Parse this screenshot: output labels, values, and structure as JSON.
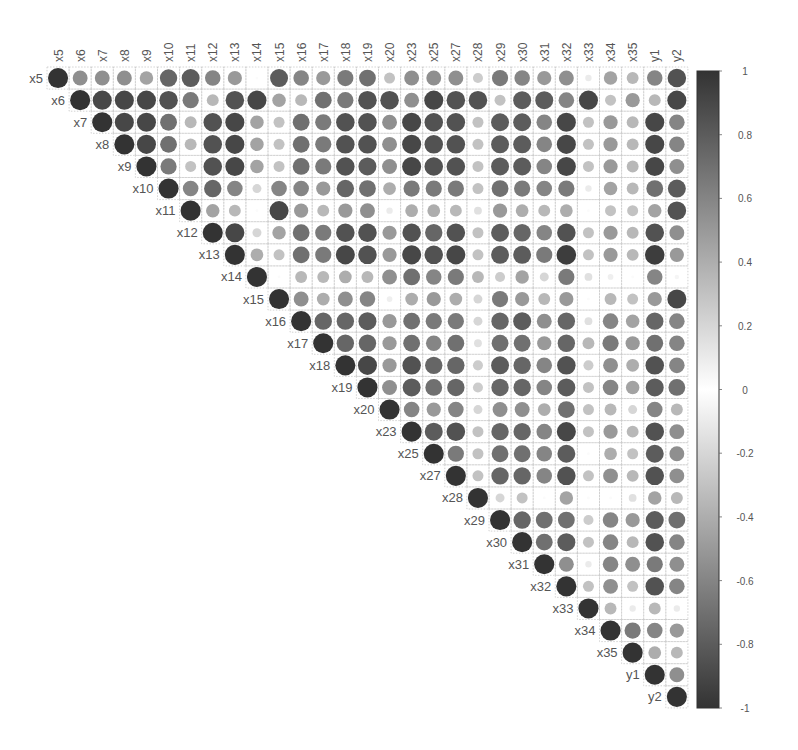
{
  "chart_data": {
    "type": "heatmap",
    "subtype": "correlation-matrix-circles-upper-triangle",
    "title": "",
    "xlabel": "",
    "ylabel": "",
    "variables": [
      "x5",
      "x6",
      "x7",
      "x8",
      "x9",
      "x10",
      "x11",
      "x12",
      "x13",
      "x14",
      "x15",
      "x16",
      "x17",
      "x18",
      "x19",
      "x20",
      "x23",
      "x25",
      "x27",
      "x28",
      "x29",
      "x30",
      "x31",
      "x32",
      "x33",
      "x34",
      "x35",
      "y1",
      "y2"
    ],
    "color_scale": {
      "min": -1,
      "max": 1,
      "ticks": [
        "1",
        "0.8",
        "0.6",
        "0.4",
        "0.2",
        "0",
        "-0.2",
        "-0.4",
        "-0.6",
        "-0.8",
        "-1"
      ],
      "high_color": "#333333",
      "mid_color": "#ffffff",
      "low_color": "#333333"
    },
    "grid": true,
    "legend_position": "right",
    "matrix_upper": [
      [
        1,
        0.55,
        0.55,
        0.55,
        0.45,
        0.75,
        0.8,
        0.6,
        0.5,
        0.02,
        0.8,
        0.6,
        0.5,
        0.65,
        0.7,
        0.3,
        0.55,
        0.55,
        0.55,
        0.25,
        0.65,
        0.6,
        0.5,
        0.55,
        0.1,
        0.45,
        0.35,
        0.6,
        0.85
      ],
      [
        1,
        0.9,
        0.9,
        0.9,
        0.85,
        0.65,
        0.35,
        0.85,
        0.9,
        0.45,
        0.35,
        0.7,
        0.65,
        0.85,
        0.85,
        0.55,
        0.9,
        0.85,
        0.85,
        0.3,
        0.8,
        0.8,
        0.6,
        0.9,
        0.3,
        0.5,
        0.35,
        0.9,
        0.6
      ],
      [
        1,
        0.9,
        0.9,
        0.7,
        0.35,
        0.85,
        0.9,
        0.45,
        0.3,
        0.7,
        0.65,
        0.85,
        0.85,
        0.55,
        0.9,
        0.85,
        0.85,
        0.3,
        0.8,
        0.8,
        0.6,
        0.9,
        0.3,
        0.5,
        0.35,
        0.9,
        0.6
      ],
      [
        1,
        0.9,
        0.7,
        0.35,
        0.85,
        0.9,
        0.45,
        0.3,
        0.7,
        0.65,
        0.85,
        0.85,
        0.55,
        0.9,
        0.85,
        0.85,
        0.3,
        0.8,
        0.8,
        0.6,
        0.9,
        0.3,
        0.5,
        0.35,
        0.9,
        0.6
      ],
      [
        1,
        0.65,
        0.3,
        0.85,
        0.9,
        0.45,
        0.3,
        0.7,
        0.65,
        0.85,
        0.8,
        0.55,
        0.9,
        0.85,
        0.85,
        0.3,
        0.8,
        0.8,
        0.6,
        0.9,
        0.3,
        0.5,
        0.35,
        0.9,
        0.55
      ],
      [
        1,
        0.6,
        0.75,
        0.6,
        0.2,
        0.6,
        0.6,
        0.5,
        0.75,
        0.7,
        0.4,
        0.65,
        0.65,
        0.65,
        0.3,
        0.7,
        0.65,
        0.6,
        0.65,
        0.1,
        0.45,
        0.35,
        0.7,
        0.8
      ],
      [
        1,
        0.45,
        0.35,
        0.02,
        0.9,
        0.5,
        0.35,
        0.5,
        0.55,
        0.1,
        0.4,
        0.4,
        0.35,
        0.15,
        0.5,
        0.4,
        0.35,
        0.4,
        0.02,
        0.3,
        0.3,
        0.45,
        0.85
      ],
      [
        1,
        0.9,
        0.2,
        0.45,
        0.7,
        0.65,
        0.85,
        0.85,
        0.5,
        0.85,
        0.75,
        0.85,
        0.3,
        0.8,
        0.75,
        0.6,
        0.85,
        0.3,
        0.5,
        0.35,
        0.85,
        0.55
      ],
      [
        1,
        0.4,
        0.3,
        0.7,
        0.65,
        0.9,
        0.85,
        0.5,
        0.9,
        0.85,
        0.9,
        0.3,
        0.8,
        0.8,
        0.65,
        0.95,
        0.3,
        0.5,
        0.35,
        0.95,
        0.5
      ],
      [
        1,
        0.02,
        0.35,
        0.35,
        0.4,
        0.35,
        0.55,
        0.7,
        0.6,
        0.65,
        0.35,
        0.25,
        0.45,
        0.2,
        0.65,
        0.15,
        0.08,
        0.02,
        0.6,
        0.05
      ],
      [
        1,
        0.55,
        0.4,
        0.55,
        0.6,
        0.08,
        0.4,
        0.5,
        0.4,
        0.2,
        0.65,
        0.5,
        0.35,
        0.5,
        0.02,
        0.35,
        0.3,
        0.5,
        0.9
      ],
      [
        1,
        0.75,
        0.75,
        0.8,
        0.5,
        0.7,
        0.65,
        0.65,
        0.2,
        0.75,
        0.8,
        0.55,
        0.75,
        0.15,
        0.6,
        0.45,
        0.75,
        0.6
      ],
      [
        1,
        0.75,
        0.75,
        0.5,
        0.7,
        0.6,
        0.7,
        0.15,
        0.7,
        0.7,
        0.5,
        0.75,
        0.35,
        0.65,
        0.5,
        0.7,
        0.6
      ],
      [
        1,
        0.9,
        0.5,
        0.85,
        0.75,
        0.75,
        0.25,
        0.8,
        0.75,
        0.6,
        0.85,
        0.25,
        0.55,
        0.4,
        0.85,
        0.6
      ],
      [
        1,
        0.55,
        0.8,
        0.7,
        0.75,
        0.25,
        0.75,
        0.75,
        0.6,
        0.8,
        0.3,
        0.6,
        0.45,
        0.8,
        0.7
      ],
      [
        1,
        0.6,
        0.5,
        0.6,
        0.2,
        0.55,
        0.55,
        0.4,
        0.7,
        0.3,
        0.35,
        0.2,
        0.6,
        0.35
      ],
      [
        1,
        0.8,
        0.85,
        0.3,
        0.75,
        0.75,
        0.6,
        0.9,
        0.3,
        0.5,
        0.35,
        0.85,
        0.55
      ],
      [
        1,
        0.65,
        0.3,
        0.7,
        0.7,
        0.6,
        0.8,
        0.02,
        0.4,
        0.3,
        0.8,
        0.55
      ],
      [
        1,
        0.3,
        0.75,
        0.75,
        0.6,
        0.85,
        0.3,
        0.55,
        0.35,
        0.85,
        0.55
      ],
      [
        1,
        0.2,
        0.3,
        0.02,
        0.45,
        0.02,
        0.02,
        0.15,
        0.45,
        0.35
      ],
      [
        1,
        0.75,
        0.7,
        0.7,
        0.25,
        0.6,
        0.5,
        0.8,
        0.7
      ],
      [
        1,
        0.7,
        0.8,
        0.3,
        0.6,
        0.35,
        0.85,
        0.6
      ],
      [
        1,
        0.55,
        0.1,
        0.6,
        0.55,
        0.65,
        0.55
      ],
      [
        1,
        0.3,
        0.55,
        0.3,
        0.85,
        0.6
      ],
      [
        1,
        0.35,
        0.1,
        0.35,
        0.1
      ],
      [
        1,
        0.65,
        0.6,
        0.5
      ],
      [
        1,
        0.4,
        0.35
      ],
      [
        1,
        0.55
      ],
      [
        1
      ]
    ]
  }
}
